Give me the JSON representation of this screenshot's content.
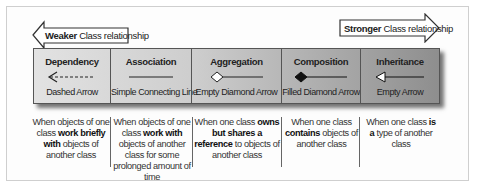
{
  "weaker_arrow": {
    "bold": "Weaker",
    "rest": " Class relationship",
    "direction": "left"
  },
  "stronger_arrow": {
    "bold": "Stronger",
    "rest": " Class relationship",
    "direction": "right"
  },
  "relationships": [
    {
      "name": "Dependency",
      "notation": "Dashed Arrow",
      "glyph": "dashed-arrow",
      "description": {
        "pre": "When objects of one class ",
        "bold": "work briefly with",
        "post": " objects of another class"
      }
    },
    {
      "name": "Association",
      "notation": "Simple Connecting Line",
      "glyph": "solid-line",
      "description": {
        "pre": "When objects of one class ",
        "bold": "work with",
        "post": " objects of another class for some prolonged amount of time"
      }
    },
    {
      "name": "Aggregation",
      "notation": "Empty Diamond Arrow",
      "glyph": "empty-diamond",
      "description": {
        "pre": "When one class ",
        "bold": "owns but shares a reference",
        "post": " to objects of another class"
      }
    },
    {
      "name": "Composition",
      "notation": "Filled Diamond Arrow",
      "glyph": "filled-diamond",
      "description": {
        "pre": "When one class ",
        "bold": "contains",
        "post": " objects of another class"
      }
    },
    {
      "name": "Inheritance",
      "notation": "Empty Arrow",
      "glyph": "empty-triangle-arrow",
      "description": {
        "pre": "When one class ",
        "bold": "is a",
        "post": " type of another class"
      }
    }
  ],
  "colors": {
    "bar_light": "#e2e2e2",
    "bar_dark": "#8e8e8e",
    "border": "#555555",
    "frame_border": "#cfcfcf"
  }
}
